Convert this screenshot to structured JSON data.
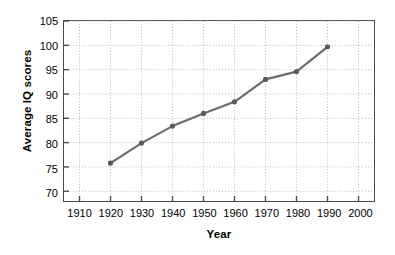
{
  "chart_data": {
    "type": "line",
    "title": "",
    "xlabel": "Year",
    "ylabel": "Average IQ scores",
    "xlim": [
      1905,
      2005
    ],
    "ylim": [
      68,
      105
    ],
    "xticks": [
      1910,
      1920,
      1930,
      1940,
      1950,
      1960,
      1970,
      1980,
      1990,
      2000
    ],
    "xticklabels": [
      "1910",
      "1920",
      "1930",
      "1940",
      "1950",
      "1960",
      "1970",
      "1980",
      "1990",
      "2000"
    ],
    "yticks": [
      70,
      75,
      80,
      85,
      90,
      95,
      100,
      105
    ],
    "yticklabels": [
      "70",
      "75",
      "80",
      "85",
      "90",
      "95",
      "100",
      "105"
    ],
    "grid": true,
    "grid_style": "dotted",
    "grid_color": "#bcbcbc",
    "legend": "none",
    "series": [
      {
        "name": "Average IQ scores",
        "color": "#6b6b6b",
        "marker": "circle",
        "x": [
          1920,
          1930,
          1940,
          1950,
          1960,
          1970,
          1980,
          1990
        ],
        "values": [
          75.8,
          79.9,
          83.4,
          86.0,
          88.4,
          93.0,
          94.6,
          99.7
        ]
      }
    ]
  },
  "style": {
    "line_color": "#6b6b6b",
    "marker_color": "#5a5a5a",
    "frame_color": "#4a4a4a",
    "grid_color": "#bcbcbc",
    "text_color": "#000000",
    "background": "#ffffff"
  }
}
